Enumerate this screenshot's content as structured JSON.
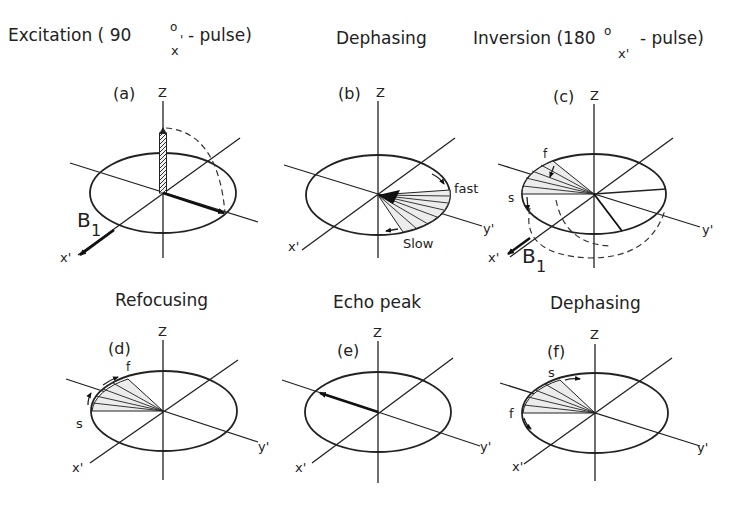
{
  "titles": {
    "excitation": "Excitation ( 90",
    "excitation_deg": "o",
    "excitation_sub": "x",
    "excitation_prime": "'",
    "excitation_tail": "- pulse)",
    "dephasing_top": "Dephasing",
    "inversion": "Inversion (180",
    "inversion_deg": "o",
    "inversion_sub": "x'",
    "inversion_tail": "- pulse)",
    "refocusing": "Refocusing",
    "echo_peak": "Echo peak",
    "dephasing_bottom": "Dephasing"
  },
  "panels": {
    "a": {
      "label": "(a)",
      "z": "Z",
      "x": "x'",
      "y": "y'",
      "b1": "B",
      "b1_sub": "1"
    },
    "b": {
      "label": "(b)",
      "z": "Z",
      "x": "x'",
      "y": "y'",
      "fast": "fast",
      "slow": "Slow"
    },
    "c": {
      "label": "(c)",
      "z": "Z",
      "x": "x'",
      "y": "y'",
      "b1": "B",
      "b1_sub": "1",
      "f": "f",
      "s": "s"
    },
    "d": {
      "label": "(d)",
      "z": "Z",
      "x": "x'",
      "y": "y'",
      "f": "f",
      "s": "s"
    },
    "e": {
      "label": "(e)",
      "z": "Z",
      "x": "x'",
      "y": "y'"
    },
    "f": {
      "label": "(f)",
      "z": "Z",
      "x": "x'",
      "y": "y'",
      "f": "f",
      "s": "s"
    }
  }
}
